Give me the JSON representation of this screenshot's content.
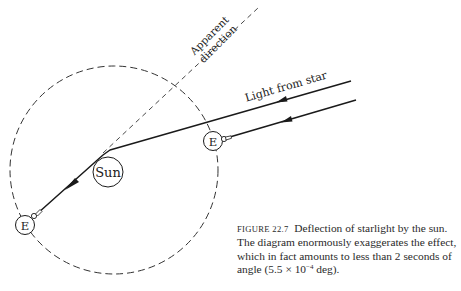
{
  "diagram": {
    "labels": {
      "apparent_direction_line1": "Apparent",
      "apparent_direction_line2": "direction",
      "light_from_star": "Light from star",
      "sun": "Sun",
      "earth_right": "E",
      "earth_left": "E"
    },
    "colors": {
      "line": "#1a1a1a",
      "dashed": "#333333",
      "background": "#ffffff"
    }
  },
  "caption": {
    "figure_label": "FIGURE 22.7",
    "text_part1": "Deflection of starlight by the sun.  The diagram enormously exaggerates the effect, which in fact amounts to less than 2 seconds of angle (5.5 × 10",
    "exponent": "−4",
    "text_part2": " deg)."
  }
}
